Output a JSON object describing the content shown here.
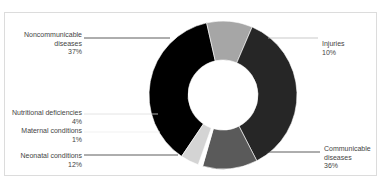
{
  "header": {
    "title_clipped": ""
  },
  "chart_data": {
    "type": "pie",
    "variant": "donut",
    "title": "",
    "categories": [
      "Noncommunicable diseases",
      "Injuries",
      "Communicable diseases",
      "Neonatal conditions",
      "Maternal conditions",
      "Nutritional deficiencies"
    ],
    "values": [
      37,
      10,
      36,
      12,
      1,
      4
    ],
    "unit": "%",
    "colors": [
      "#000000",
      "#a6a6a6",
      "#262626",
      "#5a5a5a",
      "#ffffff",
      "#d4d4d4"
    ],
    "legend_position": "callout labels"
  },
  "labels": [
    {
      "name": "Noncommunicable",
      "name2": "diseases",
      "pct": "37%"
    },
    {
      "name": "Injuries",
      "name2": "",
      "pct": "10%"
    },
    {
      "name": "Communicable",
      "name2": "diseases",
      "pct": "36%"
    },
    {
      "name": "Neonatal conditions",
      "name2": "",
      "pct": "12%"
    },
    {
      "name": "Maternal conditions",
      "name2": "",
      "pct": "1%"
    },
    {
      "name": "Nutritional deficiencies",
      "name2": "",
      "pct": "4%"
    }
  ]
}
